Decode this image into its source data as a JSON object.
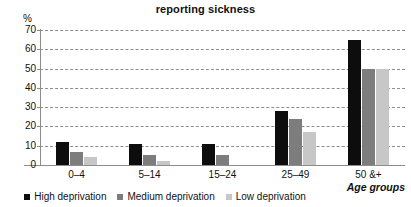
{
  "chart_data": {
    "type": "bar",
    "title": "reporting sickness",
    "xlabel": "Age groups",
    "ylabel": "%",
    "categories": [
      "0–4",
      "5–14",
      "15–24",
      "25–49",
      "50 &+"
    ],
    "series": [
      {
        "name": "High deprivation",
        "color": "#0d0d0d",
        "values": [
          12,
          11,
          11,
          28,
          65
        ]
      },
      {
        "name": "Medium deprivation",
        "color": "#7d7d7d",
        "values": [
          7,
          5,
          5,
          24,
          50
        ]
      },
      {
        "name": "Low deprivation",
        "color": "#c7c7c7",
        "values": [
          4,
          2,
          0,
          17,
          50
        ]
      }
    ],
    "ylim": [
      0,
      70
    ],
    "yticks": [
      "0",
      "10",
      "20",
      "30",
      "40",
      "50",
      "60",
      "70"
    ],
    "grid": true,
    "legend_position": "bottom"
  },
  "legend": {
    "items": [
      {
        "label": "High deprivation"
      },
      {
        "label": "Medium deprivation"
      },
      {
        "label": "Low deprivation"
      }
    ]
  }
}
